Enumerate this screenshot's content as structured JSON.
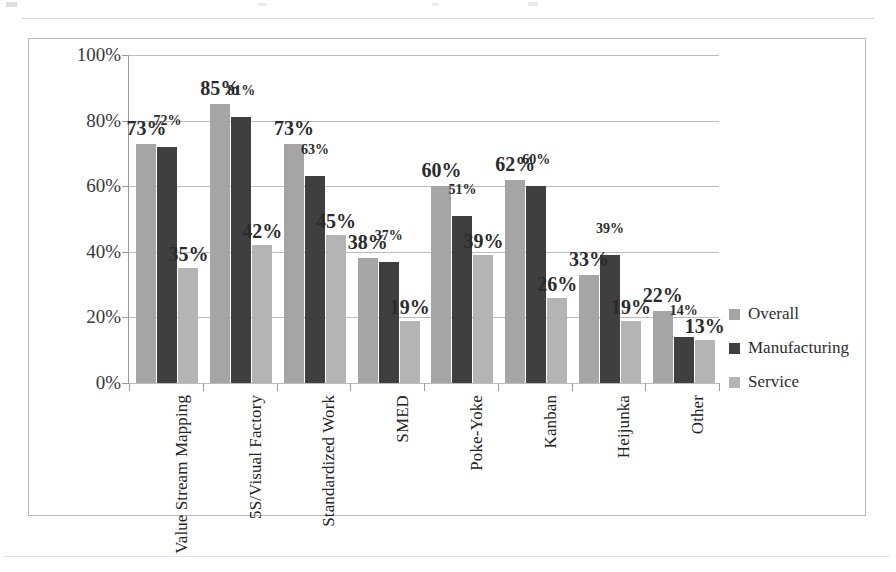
{
  "chart_data": {
    "type": "bar",
    "title": "",
    "subtitle": "",
    "xlabel": "",
    "ylabel": "",
    "ylim": [
      0,
      100
    ],
    "yticks": [
      "0%",
      "20%",
      "40%",
      "60%",
      "80%",
      "100%"
    ],
    "ytick_values": [
      0,
      20,
      40,
      60,
      80,
      100
    ],
    "grid": true,
    "legend_position": "right",
    "value_suffix": "%",
    "categories": [
      "Value Stream Mapping",
      "5S/Visual Factory",
      "Standardized Work",
      "SMED",
      "Poke-Yoke",
      "Kanban",
      "Heijunka",
      "Other"
    ],
    "series": [
      {
        "name": "Overall",
        "color": "#a5a5a5",
        "values": [
          73,
          85,
          73,
          38,
          60,
          62,
          33,
          22
        ],
        "labels": [
          "73%",
          "85%",
          "73%",
          "38%",
          "60%",
          "62%",
          "33%",
          "22%"
        ]
      },
      {
        "name": "Manufacturing",
        "color": "#3f3f3f",
        "values": [
          72,
          81,
          63,
          37,
          51,
          60,
          39,
          14
        ],
        "labels": [
          "72%",
          "81%",
          "63%",
          "37%",
          "51%",
          "60%",
          "39%",
          "14%"
        ]
      },
      {
        "name": "Service",
        "color": "#b4b4b4",
        "values": [
          35,
          42,
          45,
          19,
          39,
          26,
          19,
          13
        ],
        "labels": [
          "35%",
          "42%",
          "45%",
          "19%",
          "39%",
          "26%",
          "19%",
          "13%"
        ]
      }
    ]
  },
  "legend": {
    "items": [
      {
        "label": "Overall",
        "color": "#a5a5a5"
      },
      {
        "label": "Manufacturing",
        "color": "#3f3f3f"
      },
      {
        "label": "Service",
        "color": "#b4b4b4"
      }
    ]
  },
  "colors": {
    "frame_border": "#b9b9bd",
    "gridline": "#bcbcc0",
    "axis": "#9a9a9e",
    "text": "#2b2b2b",
    "background": "#ffffff"
  }
}
